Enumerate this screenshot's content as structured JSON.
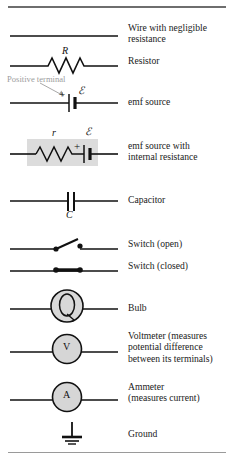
{
  "figure": {
    "type": "circuit-symbol-legend",
    "top_rule": true,
    "bottom_rule": true
  },
  "annotations": {
    "positive_terminal": "Positive terminal"
  },
  "symbol_labels": {
    "resistor_R": "R",
    "internal_resistance_r": "r",
    "emf_script_E": "ℰ",
    "emf_script_E2": "ℰ",
    "capacitor_C": "C",
    "battery_plus": "+",
    "battery_plus2": "+",
    "bulb_glyph": "",
    "voltmeter_glyph": "V",
    "ammeter_glyph": "A"
  },
  "rows": [
    {
      "id": "wire",
      "icon": "wire-symbol",
      "label_lines": [
        "Wire with negligible",
        "resistance"
      ]
    },
    {
      "id": "resistor",
      "icon": "resistor-symbol",
      "label_lines": [
        "Resistor"
      ]
    },
    {
      "id": "emf-source",
      "icon": "emf-source-symbol",
      "label_lines": [
        "emf source"
      ]
    },
    {
      "id": "emf-source-internal-resistance",
      "icon": "emf-source-internal-resistance-symbol",
      "label_lines": [
        "emf source with",
        "internal resistance"
      ]
    },
    {
      "id": "capacitor",
      "icon": "capacitor-symbol",
      "label_lines": [
        "Capacitor"
      ]
    },
    {
      "id": "switch-open",
      "icon": "switch-open-symbol",
      "label_lines": [
        "Switch (open)"
      ]
    },
    {
      "id": "switch-closed",
      "icon": "switch-closed-symbol",
      "label_lines": [
        "Switch (closed)"
      ]
    },
    {
      "id": "bulb",
      "icon": "bulb-symbol",
      "label_lines": [
        "Bulb"
      ]
    },
    {
      "id": "voltmeter",
      "icon": "voltmeter-symbol",
      "label_lines": [
        "Voltmeter (measures",
        "potential difference",
        "between its terminals)"
      ]
    },
    {
      "id": "ammeter",
      "icon": "ammeter-symbol",
      "label_lines": [
        "Ammeter",
        "(measures current)"
      ]
    },
    {
      "id": "ground",
      "icon": "ground-symbol",
      "label_lines": [
        "Ground"
      ]
    }
  ],
  "colors": {
    "ink": "#1a1a1a",
    "wire": "#111111",
    "rule": "#8c8c8c",
    "annotation_gray": "#9d9d9d",
    "shade_box": "#dcdcdc",
    "meter_fill": "#d6d6d6",
    "bulb_fill": "#d8d8d8"
  }
}
